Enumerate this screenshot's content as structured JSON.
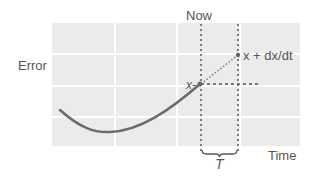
{
  "diagram": {
    "labels": {
      "y_axis": "Error",
      "x_axis": "Time",
      "now": "Now",
      "current_point": "x",
      "predicted_point": "x + dx/dt",
      "interval": "T"
    },
    "colors": {
      "grid_cell": "#ebebeb",
      "grid_line": "#ffffff",
      "curve": "#6b6b6b",
      "dotted": "#555555",
      "text": "#555555"
    }
  }
}
